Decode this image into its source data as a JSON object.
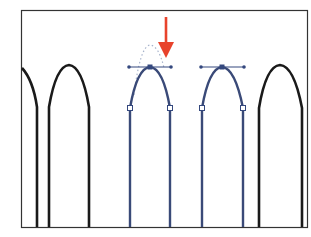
{
  "figure": {
    "colors": {
      "frame": "#333333",
      "unselected_path": "#1a1a1a",
      "selected_path": "#3a4a78",
      "handle": "#34487e",
      "anchor_fill": "#ffffff",
      "ghost_path": "#a8b4cc",
      "arrow": "#e8432c",
      "background": "#ffffff"
    },
    "arches": [
      {
        "id": "arch-1",
        "selected": false,
        "partial": true
      },
      {
        "id": "arch-2",
        "selected": false
      },
      {
        "id": "arch-3",
        "selected": true,
        "has_ghost": true
      },
      {
        "id": "arch-4",
        "selected": true
      },
      {
        "id": "arch-5",
        "selected": false
      }
    ],
    "annotation": {
      "type": "arrow",
      "direction": "down",
      "target": "arch-3 top anchor"
    }
  }
}
